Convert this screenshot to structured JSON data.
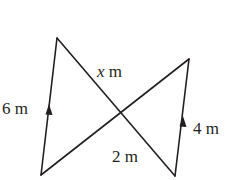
{
  "diagram": {
    "type": "geometry",
    "labels": {
      "left_side": "6 m",
      "right_side": "4 m",
      "top_segment_var": "x",
      "top_segment_unit": " m",
      "bottom_segment": "2 m"
    },
    "colors": {
      "stroke": "#231f20",
      "background": "#ffffff"
    }
  }
}
